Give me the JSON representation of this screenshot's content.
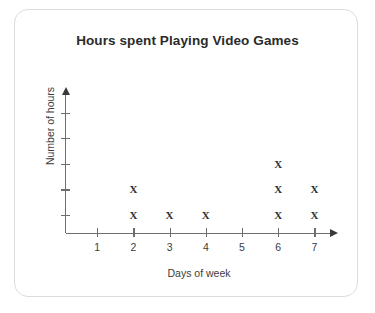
{
  "card": {
    "name": "chart-card"
  },
  "chart_data": {
    "type": "scatter",
    "plot_style": "dot-plot-x-marks",
    "title": "Hours spent Playing Video Games",
    "xlabel": "Days of week",
    "ylabel": "Number of hours",
    "categories": [
      "1",
      "2",
      "3",
      "4",
      "5",
      "6",
      "7"
    ],
    "values": [
      0,
      2,
      1,
      1,
      0,
      3,
      2
    ],
    "x_tick_labels": [
      "1",
      "2",
      "3",
      "4",
      "5",
      "6",
      "7"
    ],
    "y_tick_labels": [
      "",
      "",
      "",
      "",
      ""
    ],
    "y_tick_count": 5,
    "xlim": [
      0.5,
      7.5
    ],
    "ylim": [
      0,
      5
    ],
    "grid": false,
    "legend": null,
    "marker": "X",
    "marker_color": "#2f2f2f",
    "axis_color": "#6e6e6e",
    "title_color": "#2b2b2b",
    "background": "#ffffff",
    "border_color": "#dcdcdc",
    "points": [
      {
        "day": "2",
        "stack_index": 1
      },
      {
        "day": "2",
        "stack_index": 2
      },
      {
        "day": "3",
        "stack_index": 1
      },
      {
        "day": "4",
        "stack_index": 1
      },
      {
        "day": "6",
        "stack_index": 1
      },
      {
        "day": "6",
        "stack_index": 2
      },
      {
        "day": "6",
        "stack_index": 3
      },
      {
        "day": "7",
        "stack_index": 1
      },
      {
        "day": "7",
        "stack_index": 2
      }
    ]
  }
}
